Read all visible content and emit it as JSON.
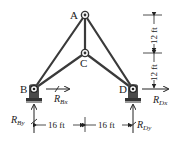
{
  "diagram": {
    "type": "truss",
    "joints": {
      "A": {
        "label": "A"
      },
      "B": {
        "label": "B"
      },
      "C": {
        "label": "C"
      },
      "D": {
        "label": "D"
      }
    },
    "members": [
      "AB",
      "AC",
      "AD",
      "BC",
      "CD"
    ],
    "reactions": {
      "Bx": {
        "symbol": "R",
        "sub": "Bx"
      },
      "By": {
        "symbol": "R",
        "sub": "By"
      },
      "Dx": {
        "symbol": "R",
        "sub": "Dx"
      },
      "Dy": {
        "symbol": "R",
        "sub": "Dy"
      }
    },
    "dimensions": {
      "horizontal_left": "16 ft",
      "horizontal_right": "16 ft",
      "vertical_top": "12 ft",
      "vertical_bottom": "12 ft"
    },
    "colors": {
      "member": "#3a3a3a",
      "support": "#4a4a4a",
      "text": "#222222"
    }
  }
}
